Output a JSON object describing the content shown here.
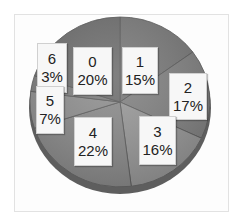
{
  "chart_data": {
    "type": "pie",
    "title": "",
    "categories": [
      "0",
      "1",
      "2",
      "3",
      "4",
      "5",
      "6"
    ],
    "values": [
      20,
      15,
      17,
      16,
      22,
      7,
      3
    ],
    "value_format": "percent",
    "labels": [
      {
        "category": "0",
        "value": "20%"
      },
      {
        "category": "1",
        "value": "15%"
      },
      {
        "category": "2",
        "value": "17%"
      },
      {
        "category": "3",
        "value": "16%"
      },
      {
        "category": "4",
        "value": "22%"
      },
      {
        "category": "5",
        "value": "7%"
      },
      {
        "category": "6",
        "value": "3%"
      }
    ],
    "colors": [
      "#6f6f6f",
      "#7a7a7a",
      "#838383",
      "#9a9a9a",
      "#8c8c8c",
      "#909090",
      "#7f7f7f"
    ],
    "style": "3d-grayscale",
    "legend": "none"
  },
  "slices": [
    {
      "cat": "0",
      "pct": "20%"
    },
    {
      "cat": "1",
      "pct": "15%"
    },
    {
      "cat": "2",
      "pct": "17%"
    },
    {
      "cat": "3",
      "pct": "16%"
    },
    {
      "cat": "4",
      "pct": "22%"
    },
    {
      "cat": "5",
      "pct": "7%"
    },
    {
      "cat": "6",
      "pct": "3%"
    }
  ]
}
